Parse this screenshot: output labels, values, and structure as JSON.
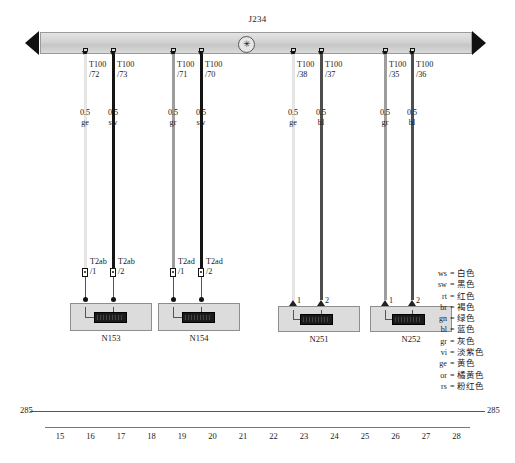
{
  "diagram": {
    "busbar": {
      "label": "J234",
      "ground_symbol": "✳",
      "arrow_left": "left-arrow",
      "arrow_right": "right-arrow"
    },
    "branches": [
      {
        "terminal": "T100",
        "pin": "/72",
        "gauge": "0.5",
        "color_code": "ge",
        "wire_color": "#eaeaea",
        "connector": "T2ab",
        "connector_pin": "/1",
        "pin_style": "plug"
      },
      {
        "terminal": "T100",
        "pin": "/73",
        "gauge": "0.5",
        "color_code": "sw",
        "wire_color": "#141414",
        "connector": "T2ab",
        "connector_pin": "/2",
        "pin_style": "plug"
      },
      {
        "terminal": "T100",
        "pin": "/71",
        "gauge": "0.5",
        "color_code": "gr",
        "wire_color": "#9d9d9d",
        "connector": "T2ad",
        "connector_pin": "/1",
        "pin_style": "plug"
      },
      {
        "terminal": "T100",
        "pin": "/70",
        "gauge": "0.5",
        "color_code": "sw",
        "wire_color": "#141414",
        "connector": "T2ad",
        "connector_pin": "/2",
        "pin_style": "plug"
      },
      {
        "terminal": "T100",
        "pin": "/38",
        "gauge": "0.5",
        "color_code": "ge",
        "wire_color": "#eaeaea",
        "connector": "",
        "connector_pin": "1",
        "pin_style": "arrow"
      },
      {
        "terminal": "T100",
        "pin": "/37",
        "gauge": "0.5",
        "color_code": "bl",
        "wire_color": "#4e4e4e",
        "connector": "",
        "connector_pin": "2",
        "pin_style": "arrow"
      },
      {
        "terminal": "T100",
        "pin": "/35",
        "gauge": "0.5",
        "color_code": "gr",
        "wire_color": "#9d9d9d",
        "connector": "",
        "connector_pin": "1",
        "pin_style": "arrow"
      },
      {
        "terminal": "T100",
        "pin": "/36",
        "gauge": "0.5",
        "color_code": "bl",
        "wire_color": "#4e4e4e",
        "connector": "",
        "connector_pin": "2",
        "pin_style": "arrow"
      }
    ],
    "components": [
      {
        "name": "N153"
      },
      {
        "name": "N154"
      },
      {
        "name": "N251"
      },
      {
        "name": "N252"
      }
    ],
    "legend": [
      {
        "abbr": "ws",
        "eq": "=",
        "name": "白色"
      },
      {
        "abbr": "sw",
        "eq": "=",
        "name": "黑色"
      },
      {
        "abbr": "rt",
        "eq": "=",
        "name": "红色"
      },
      {
        "abbr": "br",
        "eq": "=",
        "name": "褐色"
      },
      {
        "abbr": "gn",
        "eq": "=",
        "name": "绿色"
      },
      {
        "abbr": "bl",
        "eq": "=",
        "name": "蓝色"
      },
      {
        "abbr": "gr",
        "eq": "=",
        "name": "灰色"
      },
      {
        "abbr": "vi",
        "eq": "=",
        "name": "淡紫色"
      },
      {
        "abbr": "ge",
        "eq": "=",
        "name": "黄色"
      },
      {
        "abbr": "or",
        "eq": "=",
        "name": "橘黄色"
      },
      {
        "abbr": "rs",
        "eq": "=",
        "name": "粉红色"
      }
    ],
    "scale": {
      "left_label": "285",
      "right_label": "285",
      "ticks": [
        "15",
        "16",
        "17",
        "18",
        "19",
        "20",
        "21",
        "22",
        "23",
        "24",
        "25",
        "26",
        "27",
        "28"
      ]
    }
  }
}
